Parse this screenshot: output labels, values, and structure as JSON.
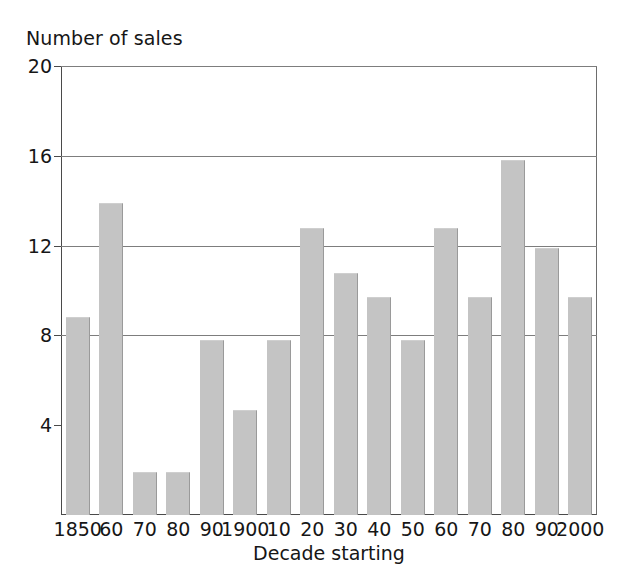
{
  "chart_data": {
    "type": "bar",
    "title": "Number of sales",
    "xlabel": "Decade starting",
    "ylabel": "Number of sales",
    "categories": [
      "1850",
      "60",
      "70",
      "80",
      "90",
      "1900",
      "10",
      "20",
      "30",
      "40",
      "50",
      "60",
      "70",
      "80",
      "90",
      "2000"
    ],
    "values": [
      8.8,
      13.9,
      1.9,
      1.9,
      7.8,
      4.7,
      7.8,
      12.8,
      10.8,
      9.7,
      7.8,
      12.8,
      9.7,
      15.8,
      11.9,
      9.7
    ],
    "ylim": [
      0,
      20
    ],
    "yticks": [
      4,
      8,
      12,
      16,
      20
    ],
    "ytick_labels": [
      "4",
      "8",
      "12",
      "16",
      "20"
    ],
    "gridlines": [
      8,
      12,
      16,
      20
    ],
    "grid": true,
    "legend": null,
    "colors": {
      "bar_fill": "#c4c4c4",
      "bar_edge": "#9a9a9a",
      "axis": "#4a4a4a",
      "grid": "#7d7d7d",
      "text": "#161616",
      "background": "#ffffff"
    }
  }
}
